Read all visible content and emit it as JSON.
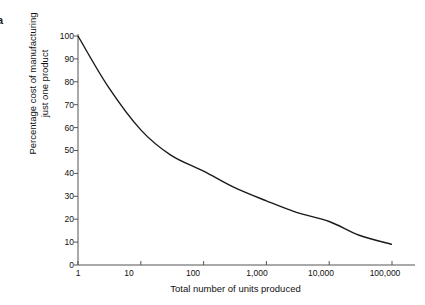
{
  "panel": {
    "letter": "a"
  },
  "axes": {
    "ylabel_line1": "Percentage cost of manufacturing",
    "ylabel_line2": "just one product",
    "ylabel": "Percentage cost of manufacturing\njust one product",
    "xlabel": "Total number of units produced",
    "ytick_labels": [
      "100",
      "90",
      "80",
      "70",
      "60",
      "50",
      "40",
      "30",
      "20",
      "10",
      "0"
    ],
    "xtick_labels": [
      "1",
      "10",
      "100",
      "1,000",
      "10,000",
      "100,000"
    ]
  },
  "style": {
    "curve_color": "#1a1a1a",
    "axis_color": "#555555",
    "background": "#ffffff"
  },
  "chart_data": {
    "type": "line",
    "title": "",
    "xlabel": "Total number of units produced",
    "ylabel": "Percentage cost of manufacturing just one product",
    "xscale": "log",
    "xlim": [
      1,
      100000
    ],
    "ylim": [
      0,
      100
    ],
    "ytick_values": [
      0,
      10,
      20,
      30,
      40,
      50,
      60,
      70,
      80,
      90,
      100
    ],
    "xtick_values": [
      1,
      10,
      100,
      1000,
      10000,
      100000
    ],
    "grid": false,
    "legend": null,
    "series": [
      {
        "name": "Experience curve",
        "x": [
          1,
          3,
          10,
          30,
          100,
          300,
          1000,
          3000,
          10000,
          30000,
          100000
        ],
        "y": [
          100,
          78,
          59,
          48,
          41,
          34,
          28,
          23,
          19,
          13,
          9
        ]
      }
    ]
  }
}
